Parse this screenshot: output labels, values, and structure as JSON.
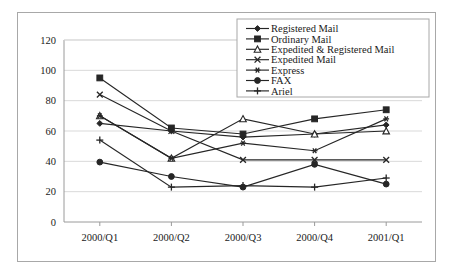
{
  "chart_data": {
    "type": "line",
    "title": "",
    "subtitle": "",
    "xlabel": "",
    "ylabel": "",
    "categories": [
      "2000/Q1",
      "2000/Q2",
      "2000/Q3",
      "2000/Q4",
      "2001/Q1"
    ],
    "ylim": [
      0,
      120
    ],
    "yticks": [
      0,
      20,
      40,
      60,
      80,
      100,
      120
    ],
    "grid": true,
    "legend_position": "top-right",
    "series": [
      {
        "name": "Registered Mail",
        "marker": "diamond",
        "values": [
          65,
          60,
          56,
          58,
          64
        ]
      },
      {
        "name": "Ordinary Mail",
        "marker": "square",
        "values": [
          95,
          62,
          58,
          68,
          74
        ]
      },
      {
        "name": "Expedited & Registered Mail",
        "marker": "triangle",
        "values": [
          70,
          42,
          68,
          58,
          60
        ]
      },
      {
        "name": "Expedited Mail",
        "marker": "x-cross",
        "values": [
          84,
          60,
          41,
          41,
          41
        ]
      },
      {
        "name": "Express",
        "marker": "asterisk",
        "values": [
          70,
          42,
          52,
          47,
          68
        ]
      },
      {
        "name": "FAX",
        "marker": "circle",
        "values": [
          39.5,
          30,
          23,
          38,
          25
        ]
      },
      {
        "name": "Ariel",
        "marker": "plus",
        "values": [
          54,
          23,
          24,
          23,
          29
        ]
      }
    ]
  },
  "axes": {
    "y_tick_labels": [
      "120",
      "100",
      "80",
      "60",
      "40",
      "20",
      "0"
    ],
    "x_tick_labels": [
      "2000/Q1",
      "2000/Q2",
      "2000/Q3",
      "2000/Q4",
      "2001/Q1"
    ]
  },
  "legend": {
    "entries": [
      {
        "label": "Registered Mail"
      },
      {
        "label": "Ordinary Mail"
      },
      {
        "label": "Expedited & Registered Mail"
      },
      {
        "label": "Expedited Mail"
      },
      {
        "label": "Express"
      },
      {
        "label": "FAX"
      },
      {
        "label": "Ariel"
      }
    ]
  },
  "colors": {
    "line": "#262626",
    "grid": "#d9d9d9",
    "axis": "#9a9a9a",
    "frame": "#a8a8a8",
    "background": "#ffffff"
  }
}
